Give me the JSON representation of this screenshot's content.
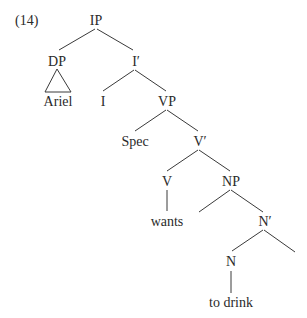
{
  "example_number": "(14)",
  "tree": {
    "root": "IP",
    "nodes": {
      "ip": "IP",
      "dp": "DP",
      "ariel": "Ariel",
      "i_bar": "I′",
      "i": "I",
      "vp": "VP",
      "spec": "Spec",
      "v_bar": "V′",
      "v": "V",
      "wants": "wants",
      "np": "NP",
      "n_bar": "N′",
      "n": "N",
      "to_drink": "to drink"
    },
    "structure": "[IP [DP △ Ariel] [I′ I [VP Spec [V′ [V wants] [NP _ [N′ [N to drink] _ ]]]]]]"
  }
}
